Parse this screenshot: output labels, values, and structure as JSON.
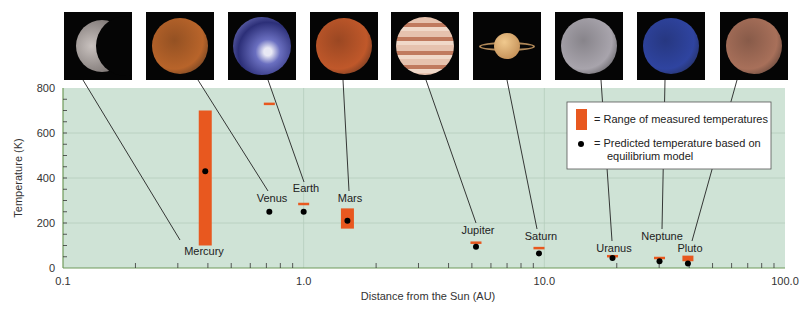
{
  "chart_data": {
    "type": "scatter",
    "title": "",
    "xlabel": "Distance from the Sun (AU)",
    "ylabel": "Temperature (K)",
    "xscale": "log",
    "xlim": [
      0.1,
      100.0
    ],
    "ylim": [
      0,
      800
    ],
    "x_ticks": [
      "0.1",
      "1.0",
      "10.0",
      "100.0"
    ],
    "y_ticks": [
      "0",
      "200",
      "400",
      "600",
      "800"
    ],
    "grid": true,
    "legend_position": "upper right",
    "legend": [
      {
        "symbol": "orange-bar",
        "label": "= Range of measured temperatures"
      },
      {
        "symbol": "black-dot",
        "label": "= Predicted temperature based on",
        "label2": "equilibrium model"
      }
    ],
    "series": [
      {
        "name": "Range of measured temperatures",
        "kind": "range",
        "points": [
          {
            "planet": "Mercury",
            "x": 0.39,
            "low": 100,
            "high": 700
          },
          {
            "planet": "Venus",
            "x": 0.72,
            "low": 725,
            "high": 735
          },
          {
            "planet": "Earth",
            "x": 1.0,
            "low": 280,
            "high": 290
          },
          {
            "planet": "Mars",
            "x": 1.52,
            "low": 175,
            "high": 265
          },
          {
            "planet": "Jupiter",
            "x": 5.2,
            "low": 112,
            "high": 118
          },
          {
            "planet": "Saturn",
            "x": 9.5,
            "low": 88,
            "high": 94
          },
          {
            "planet": "Uranus",
            "x": 19.2,
            "low": 50,
            "high": 58
          },
          {
            "planet": "Neptune",
            "x": 30.1,
            "low": 45,
            "high": 50
          },
          {
            "planet": "Pluto",
            "x": 39.5,
            "low": 30,
            "high": 55
          }
        ]
      },
      {
        "name": "Predicted temperature based on equilibrium model",
        "kind": "point",
        "points": [
          {
            "planet": "Mercury",
            "x": 0.39,
            "y": 430
          },
          {
            "planet": "Venus",
            "x": 0.72,
            "y": 250
          },
          {
            "planet": "Earth",
            "x": 1.0,
            "y": 250
          },
          {
            "planet": "Mars",
            "x": 1.52,
            "y": 210
          },
          {
            "planet": "Jupiter",
            "x": 5.2,
            "y": 95
          },
          {
            "planet": "Saturn",
            "x": 9.5,
            "y": 65
          },
          {
            "planet": "Uranus",
            "x": 19.2,
            "y": 45
          },
          {
            "planet": "Neptune",
            "x": 30.1,
            "y": 30
          },
          {
            "planet": "Pluto",
            "x": 39.5,
            "y": 20
          }
        ]
      }
    ]
  },
  "planets": [
    {
      "name": "Mercury",
      "img_x": 64,
      "label_x": 204,
      "label_y": 255,
      "line_to": [
        180,
        240
      ],
      "color": "#9a9290",
      "kind": "crescent"
    },
    {
      "name": "Venus",
      "img_x": 146,
      "label_x": 272,
      "label_y": 202,
      "line_to": [
        268,
        191
      ],
      "color": "#b8642a",
      "kind": "disc"
    },
    {
      "name": "Earth",
      "img_x": 228,
      "label_x": 306,
      "label_y": 192,
      "line_to": [
        304,
        182
      ],
      "color": "#4a4f9c",
      "kind": "earth"
    },
    {
      "name": "Mars",
      "img_x": 310,
      "label_x": 350,
      "label_y": 202,
      "line_to": [
        349,
        191
      ],
      "color": "#c0582a",
      "kind": "disc"
    },
    {
      "name": "Jupiter",
      "img_x": 391,
      "label_x": 478,
      "label_y": 234,
      "line_to": [
        476,
        223
      ],
      "color": "#c98a6c",
      "kind": "banded"
    },
    {
      "name": "Saturn",
      "img_x": 473,
      "label_x": 541,
      "label_y": 240,
      "line_to": [
        537,
        229
      ],
      "color": "#d9a56a",
      "kind": "ringed"
    },
    {
      "name": "Uranus",
      "img_x": 555,
      "label_x": 614,
      "label_y": 252,
      "line_to": [
        612,
        241
      ],
      "color": "#a8a4ac",
      "kind": "disc"
    },
    {
      "name": "Neptune",
      "img_x": 637,
      "label_x": 662,
      "label_y": 240,
      "line_to": [
        662,
        229
      ],
      "color": "#2f44a0",
      "kind": "disc"
    },
    {
      "name": "Pluto",
      "img_x": 720,
      "label_x": 690,
      "label_y": 252,
      "line_to": [
        692,
        241
      ],
      "color": "#a8705a",
      "kind": "disc"
    }
  ],
  "colors": {
    "plot_bg": "#cfe3d6",
    "grid": "#b5cdbd",
    "axis": "#6f9a5a",
    "range_bar": "#e8581f",
    "dot": "#000000",
    "leader_line": "#222222"
  }
}
